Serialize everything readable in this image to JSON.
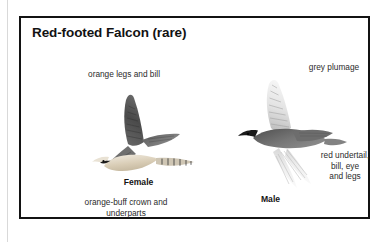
{
  "plate": {
    "title": "Red-footed Falcon (rare)",
    "border_color": "#131313",
    "background_color": "#ffffff"
  },
  "female": {
    "label": "Female",
    "top_caption": "orange legs and bill",
    "bottom_caption": "orange-buff crown and\nunderparts",
    "plumage_colors": {
      "upperwing": "#4f4f4f",
      "underparts": "#d8cdba",
      "head": "#e8e2d6",
      "tail_bars": "#3c3c3c"
    }
  },
  "male": {
    "label": "Male",
    "top_caption": "grey plumage",
    "side_caption": "red undertail,\nbill, eye\nand legs",
    "plumage_colors": {
      "body": "#6e6e6e",
      "head": "#1e1e1e",
      "underwing": "#f2f2f2",
      "upperwing": "#cfcfcf"
    }
  },
  "icons": {
    "female_bird": "falcon-in-flight-female",
    "male_bird": "falcon-in-flight-male"
  }
}
